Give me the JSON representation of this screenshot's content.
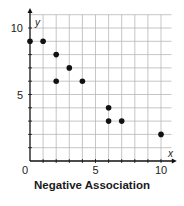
{
  "chart_data": {
    "type": "scatter",
    "title": "Negative Association",
    "xlabel": "x",
    "ylabel": "y",
    "xlim": [
      0,
      10.8
    ],
    "ylim": [
      0,
      11
    ],
    "grid": true,
    "x_ticks": [
      0,
      5,
      10
    ],
    "y_ticks": [
      5,
      10
    ],
    "origin_label": "0",
    "points": [
      {
        "x": 0,
        "y": 9
      },
      {
        "x": 1,
        "y": 9
      },
      {
        "x": 2,
        "y": 8
      },
      {
        "x": 2,
        "y": 6
      },
      {
        "x": 3,
        "y": 7
      },
      {
        "x": 4,
        "y": 6
      },
      {
        "x": 6,
        "y": 4
      },
      {
        "x": 6,
        "y": 3
      },
      {
        "x": 7,
        "y": 3
      },
      {
        "x": 10,
        "y": 2
      }
    ],
    "colors": {
      "grid": "#b8b8b8",
      "axis": "#111111",
      "point": "#111111"
    }
  }
}
